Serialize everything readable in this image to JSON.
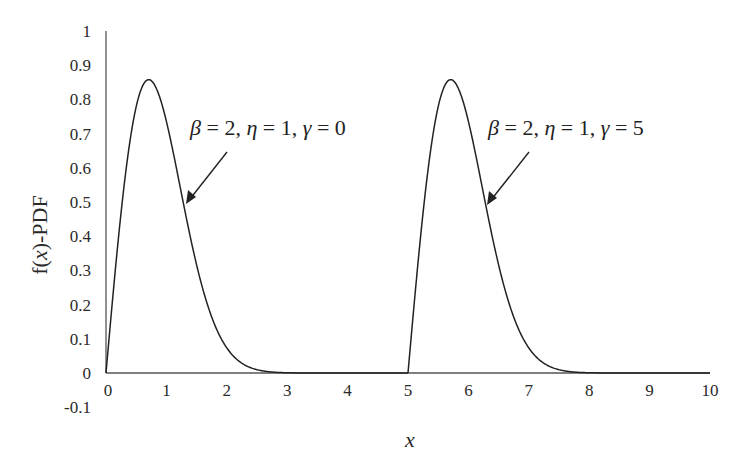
{
  "chart_data": {
    "type": "line",
    "title": "",
    "xlabel": "x",
    "ylabel": "f(x)-PDF",
    "xlim": [
      0,
      10
    ],
    "ylim": [
      -0.1,
      1
    ],
    "grid": false,
    "legend": null,
    "x_ticks": [
      "0",
      "1",
      "2",
      "3",
      "4",
      "5",
      "6",
      "7",
      "8",
      "9",
      "10"
    ],
    "y_ticks": [
      "1",
      "0.9",
      "0.8",
      "0.7",
      "0.6",
      "0.5",
      "0.4",
      "0.3",
      "0.2",
      "0.1",
      "0",
      "-0.1"
    ],
    "series": [
      {
        "name": "β = 2, η = 1, γ = 0",
        "beta": 2,
        "eta": 1,
        "gamma": 0,
        "x": [
          0,
          0.1,
          0.2,
          0.3,
          0.4,
          0.5,
          0.6,
          0.707,
          0.8,
          0.9,
          1.0,
          1.2,
          1.4,
          1.6,
          1.8,
          2.0,
          2.2,
          2.5,
          3.0,
          4.0,
          5.0
        ],
        "values": [
          0,
          0.198,
          0.384,
          0.548,
          0.682,
          0.779,
          0.837,
          0.858,
          0.844,
          0.8,
          0.736,
          0.569,
          0.395,
          0.247,
          0.141,
          0.073,
          0.035,
          0.01,
          0.001,
          0,
          0
        ]
      },
      {
        "name": "β = 2, η = 1, γ = 5",
        "beta": 2,
        "eta": 1,
        "gamma": 5,
        "x": [
          5,
          5.1,
          5.2,
          5.3,
          5.4,
          5.5,
          5.6,
          5.707,
          5.8,
          5.9,
          6.0,
          6.2,
          6.4,
          6.6,
          6.8,
          7.0,
          7.2,
          7.5,
          8.0,
          9.0,
          10.0
        ],
        "values": [
          0,
          0.198,
          0.384,
          0.548,
          0.682,
          0.779,
          0.837,
          0.858,
          0.844,
          0.8,
          0.736,
          0.569,
          0.395,
          0.247,
          0.141,
          0.073,
          0.035,
          0.01,
          0.001,
          0,
          0
        ]
      }
    ],
    "annotations": [
      {
        "text": "β = 2, η = 1, γ = 0",
        "arrow_to": [
          1.33,
          0.5
        ]
      },
      {
        "text": "β = 2, η = 1, γ = 5",
        "arrow_to": [
          6.33,
          0.5
        ]
      }
    ]
  },
  "labels": {
    "ylabel": "f(x)-PDF",
    "ylabel_prefix": "f(",
    "ylabel_var": "x",
    "ylabel_suffix": ")-PDF",
    "xlabel": "x",
    "annotation_1": {
      "beta": "β",
      "eq1": " = 2, ",
      "eta": "η",
      "eq2": " = 1, ",
      "gamma": "γ",
      "eq3": " = 0"
    },
    "annotation_2": {
      "beta": "β",
      "eq1": " = 2, ",
      "eta": "η",
      "eq2": " = 1, ",
      "gamma": "γ",
      "eq3": " = 5"
    }
  }
}
